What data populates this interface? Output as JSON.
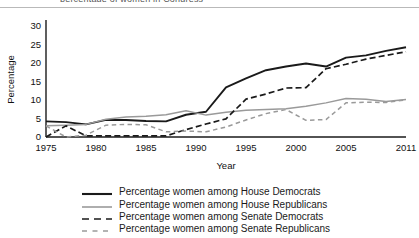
{
  "figure": {
    "clipped_caption_text": "percentage of women in Congress",
    "axis_label_y": "Percentage",
    "axis_label_x": "Year"
  },
  "chart_data": {
    "type": "line",
    "title": "",
    "xlabel": "Year",
    "ylabel": "Percentage",
    "xlim": [
      1975,
      2011
    ],
    "ylim": [
      0,
      31
    ],
    "yticks": [
      0,
      5,
      10,
      15,
      20,
      25,
      30
    ],
    "xticks": [
      1975,
      1980,
      1985,
      1990,
      1995,
      2000,
      2005,
      2011
    ],
    "grid": false,
    "legend_position": "below",
    "x": [
      1975,
      1977,
      1979,
      1981,
      1983,
      1985,
      1987,
      1989,
      1991,
      1993,
      1995,
      1997,
      1999,
      2001,
      2003,
      2005,
      2007,
      2009,
      2011
    ],
    "series": [
      {
        "name": "Percentage women among House Democrats",
        "style": "solid",
        "color": "#1a1a1a",
        "width": 1.9,
        "values": [
          4.2,
          4.0,
          3.4,
          4.6,
          4.6,
          4.3,
          4.2,
          6.0,
          6.8,
          13.4,
          15.8,
          18.0,
          19.0,
          19.8,
          19.0,
          21.4,
          22.0,
          23.2,
          24.2
        ]
      },
      {
        "name": "Percentage women among House Republicans",
        "style": "solid",
        "color": "#9a9a9a",
        "width": 1.5,
        "values": [
          3.0,
          3.2,
          3.4,
          4.8,
          5.4,
          5.6,
          6.0,
          7.1,
          5.9,
          6.7,
          7.2,
          7.4,
          7.6,
          8.3,
          9.2,
          10.4,
          10.2,
          9.6,
          10.1
        ]
      },
      {
        "name": "Percentage women among Senate Democrats",
        "style": "dashed-long",
        "color": "#1a1a1a",
        "width": 1.7,
        "values": [
          0.0,
          3.0,
          0.3,
          0.3,
          0.3,
          0.3,
          0.3,
          2.0,
          3.5,
          4.9,
          10.2,
          11.6,
          13.2,
          13.3,
          18.4,
          19.6,
          21.0,
          22.0,
          23.0
        ]
      },
      {
        "name": "Percentage women among Senate Republicans",
        "style": "dashed-short",
        "color": "#9a9a9a",
        "width": 1.5,
        "values": [
          3.0,
          0.0,
          0.5,
          3.2,
          3.4,
          3.3,
          1.4,
          1.6,
          1.4,
          2.7,
          4.6,
          6.3,
          7.4,
          4.5,
          4.7,
          9.2,
          9.4,
          9.3,
          10.0
        ]
      }
    ]
  },
  "legend": {
    "items": [
      {
        "label": "Percentage women among House Democrats",
        "style": "solid",
        "color": "#1a1a1a"
      },
      {
        "label": "Percentage women among House Republicans",
        "style": "solid",
        "color": "#9a9a9a"
      },
      {
        "label": "Percentage women among Senate Democrats",
        "style": "dashed-long",
        "color": "#1a1a1a"
      },
      {
        "label": "Percentage women among Senate Republicans",
        "style": "dashed-short",
        "color": "#9a9a9a"
      }
    ]
  }
}
